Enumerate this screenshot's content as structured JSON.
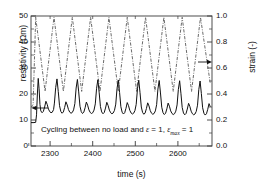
{
  "chart_data": {
    "type": "line",
    "title": "",
    "xlabel": "time (s)",
    "ylabel": "resistivity (Ωm)",
    "y2label": "strain (-)",
    "xlim": [
      2255,
      2680
    ],
    "ylim": [
      0,
      50
    ],
    "y2lim": [
      0.0,
      1.0
    ],
    "grid": false,
    "legend": "none",
    "xticks": [
      2300,
      2400,
      2500,
      2600
    ],
    "xtick_labels": [
      "2300",
      "2400",
      "2500",
      "2600"
    ],
    "xminor_ticks": [
      2250,
      2350,
      2450,
      2550,
      2650
    ],
    "yticks": [
      0,
      10,
      20,
      30,
      40,
      50
    ],
    "ytick_labels": [
      "0",
      "10",
      "20",
      "30",
      "40",
      "50"
    ],
    "y2ticks": [
      0.0,
      0.2,
      0.4,
      0.6,
      0.8,
      1.0
    ],
    "y2tick_labels": [
      "0.0",
      "0.2",
      "0.4",
      "0.6",
      "0.8",
      "1.0"
    ],
    "annotations": [
      {
        "name": "cycling-caption",
        "text": "Cycling between no load and ε = 1, εmax = 1",
        "x": 2300,
        "y": 5.5
      },
      {
        "name": "left-axis-arrow",
        "text": "←",
        "points_to": "resistivity-axis"
      },
      {
        "name": "right-axis-arrow",
        "text": "→",
        "points_to": "strain-axis"
      }
    ],
    "series": [
      {
        "name": "resistivity",
        "axis": "left",
        "style": "solid",
        "color": "#1a1a1a",
        "unit": "Ωm",
        "cycle_count": 10,
        "baseline": 9.0,
        "tall_peak_value": 26.0,
        "short_peak_value": 17.5,
        "trough_value": 11.5,
        "x": [
          2255,
          2262,
          2266,
          2268,
          2270,
          2272,
          2274,
          2276,
          2278,
          2281,
          2284,
          2287,
          2290,
          2293,
          2296,
          2299,
          2302,
          2305,
          2308,
          2310,
          2313,
          2316,
          2319,
          2322,
          2325,
          2328,
          2331,
          2334,
          2337,
          2340,
          2343,
          2346,
          2349,
          2352,
          2355,
          2358,
          2361,
          2364,
          2367,
          2370,
          2373,
          2376,
          2379,
          2382,
          2385,
          2388,
          2391,
          2394,
          2397,
          2400,
          2403,
          2406,
          2409,
          2412,
          2415,
          2418,
          2421,
          2424,
          2427,
          2430,
          2433,
          2436,
          2439,
          2442,
          2445,
          2448,
          2451,
          2454,
          2457,
          2460,
          2463,
          2466,
          2469,
          2472,
          2475,
          2478,
          2481,
          2484,
          2487,
          2490,
          2493,
          2496,
          2499,
          2502,
          2505,
          2508,
          2511,
          2514,
          2517,
          2520,
          2523,
          2526,
          2529,
          2532,
          2535,
          2538,
          2541,
          2544,
          2547,
          2550,
          2553,
          2556,
          2559,
          2562,
          2565,
          2568,
          2571,
          2574,
          2577,
          2580,
          2583,
          2586,
          2589,
          2592,
          2595,
          2598,
          2601,
          2604,
          2607,
          2610,
          2613,
          2616,
          2619,
          2622,
          2625,
          2628,
          2631,
          2634,
          2637,
          2640,
          2643,
          2646,
          2649,
          2652,
          2655,
          2658,
          2661,
          2664,
          2667,
          2670,
          2673,
          2676
        ],
        "y": [
          9.0,
          9.0,
          9.1,
          12.0,
          20.0,
          26.0,
          22.0,
          16.0,
          13.5,
          12.8,
          13.3,
          15.0,
          17.2,
          16.0,
          14.2,
          13.2,
          12.8,
          13.0,
          14.0,
          16.5,
          22.5,
          25.8,
          21.0,
          15.5,
          13.3,
          12.6,
          13.1,
          14.8,
          17.0,
          15.8,
          14.0,
          13.0,
          12.6,
          12.9,
          13.9,
          16.3,
          22.3,
          25.6,
          20.8,
          15.3,
          13.2,
          12.5,
          13.0,
          14.7,
          16.9,
          15.7,
          13.9,
          12.9,
          12.5,
          12.8,
          13.8,
          16.2,
          22.2,
          25.5,
          20.7,
          15.2,
          13.1,
          12.4,
          12.9,
          14.6,
          16.8,
          15.6,
          13.8,
          12.8,
          12.4,
          12.7,
          13.7,
          16.1,
          22.1,
          25.4,
          20.6,
          15.1,
          13.0,
          12.3,
          12.8,
          14.5,
          16.7,
          15.5,
          13.7,
          12.7,
          12.3,
          12.6,
          13.6,
          16.0,
          22.0,
          25.3,
          20.5,
          15.0,
          12.9,
          12.2,
          12.7,
          14.4,
          16.6,
          15.4,
          13.6,
          12.6,
          12.2,
          12.5,
          13.5,
          15.9,
          21.9,
          25.2,
          20.4,
          14.9,
          12.8,
          12.1,
          12.6,
          14.3,
          16.5,
          15.3,
          13.5,
          12.5,
          12.1,
          12.4,
          13.4,
          15.8,
          21.8,
          25.1,
          20.3,
          14.8,
          12.7,
          12.0,
          12.5,
          14.2,
          16.4,
          15.2,
          13.4,
          12.4,
          12.0,
          12.3,
          13.3,
          15.7,
          21.7,
          25.0,
          20.2,
          14.7,
          12.6,
          11.9,
          12.4,
          14.1,
          16.3,
          15.1
        ]
      },
      {
        "name": "strain",
        "axis": "right",
        "style": "dash-dot",
        "color": "#555555",
        "unit": "-",
        "cycle_count": 10,
        "peak_value": 0.99,
        "trough_value": 0.4,
        "start_value": 0.32,
        "x": [
          2255,
          2260,
          2266,
          2288,
          2309,
          2331,
          2352,
          2374,
          2395,
          2417,
          2438,
          2460,
          2481,
          2503,
          2524,
          2546,
          2567,
          2589,
          2610,
          2632,
          2653,
          2676
        ],
        "y": [
          0.3,
          0.32,
          0.99,
          0.42,
          0.99,
          0.42,
          0.99,
          0.42,
          0.99,
          0.42,
          0.99,
          0.42,
          0.99,
          0.42,
          0.99,
          0.42,
          0.99,
          0.42,
          0.99,
          0.42,
          0.99,
          0.48
        ]
      }
    ]
  },
  "axes": {
    "left_title": "resistivity (Ωm)",
    "right_title": "strain (-)",
    "bottom_title": "time (s)"
  },
  "caption": {
    "prefix": "Cycling between no load and ",
    "eps1": "ε",
    "mid": " = 1, ",
    "eps2": "ε",
    "sub": "max",
    "suffix": " = 1"
  }
}
